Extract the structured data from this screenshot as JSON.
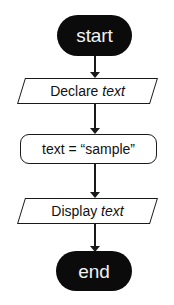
{
  "diagram": {
    "background_color": "#ffffff",
    "stroke_color": "#1a1a1a",
    "terminator_fill": "#0b0b0b",
    "terminator_text_color": "#f2f2f2",
    "nodes": [
      {
        "id": "start",
        "shape": "terminator",
        "label": "start"
      },
      {
        "id": "declare",
        "shape": "parallelogram",
        "label_prefix": "Declare ",
        "label_variable": "text"
      },
      {
        "id": "assign",
        "shape": "rounded-rectangle",
        "label": "text = “sample”"
      },
      {
        "id": "display",
        "shape": "parallelogram",
        "label_prefix": "Display ",
        "label_variable": "text"
      },
      {
        "id": "end",
        "shape": "terminator",
        "label": "end"
      }
    ],
    "connectors": [
      {
        "id": "c1",
        "from": "start",
        "to": "declare",
        "direction": "down"
      },
      {
        "id": "c2",
        "from": "declare",
        "to": "assign",
        "direction": "down"
      },
      {
        "id": "c3",
        "from": "assign",
        "to": "display",
        "direction": "down"
      },
      {
        "id": "c4",
        "from": "display",
        "to": "end",
        "direction": "down"
      }
    ]
  }
}
